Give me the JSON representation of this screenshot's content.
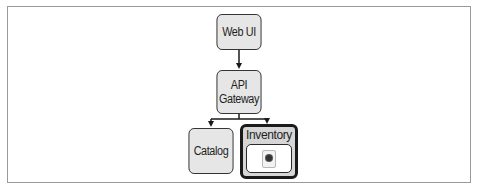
{
  "diagram": {
    "nodes": [
      {
        "id": "web-ui",
        "label": "Web UI"
      },
      {
        "id": "api-gateway",
        "label_line1": "API",
        "label_line2": "Gateway"
      },
      {
        "id": "catalog",
        "label": "Catalog"
      },
      {
        "id": "inventory",
        "label": "Inventory",
        "highlighted": true,
        "contains": "pod-icon"
      }
    ],
    "edges": [
      {
        "from": "web-ui",
        "to": "api-gateway"
      },
      {
        "from": "api-gateway",
        "to": "catalog"
      },
      {
        "from": "api-gateway",
        "to": "inventory"
      }
    ],
    "colors": {
      "node_fill": "#e6e6e6",
      "node_border": "#2a2a2a",
      "highlight_border": "#1a1a1a",
      "frame_border": "#9a9a9a"
    }
  }
}
